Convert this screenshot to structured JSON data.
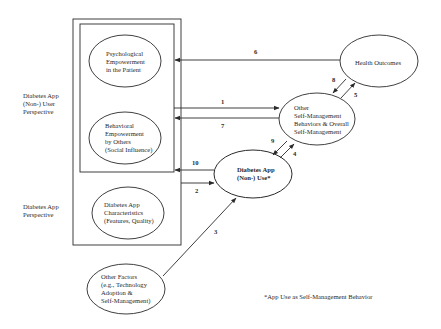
{
  "diagram": {
    "perspectives": {
      "user": [
        "Diabetes App",
        "(Non-) User",
        "Perspective"
      ],
      "app": [
        "Diabetes App",
        "Perspective"
      ]
    },
    "nodes": {
      "psychological": [
        "Psychological",
        "Empowerment",
        "in the Patient"
      ],
      "behavioral": [
        "Behavioral",
        "Empowerment",
        "by Others",
        "(Social Influence)"
      ],
      "characteristics": [
        "Diabetes App",
        "Characteristics",
        "(Features, Quality)"
      ],
      "other_factors": [
        "Other Factors",
        "(e.g., Technology",
        "Adoption &",
        "Self-Management)"
      ],
      "health_outcomes": [
        "Health Outcomes"
      ],
      "other_self_mgmt": [
        "Other",
        "Self-Management",
        "Behaviors & Overall",
        "Self-Management"
      ],
      "app_use": [
        "Diabetes App",
        "(Non-) Use*"
      ]
    },
    "paths": {
      "p1": "1",
      "p2": "2",
      "p3": "3",
      "p4": "4",
      "p5": "5",
      "p6": "6",
      "p7": "7",
      "p8": "8",
      "p9": "9",
      "p10": "10"
    },
    "footnote": "*App Use as Self-Management Behavior",
    "colors": {
      "stroke": "#2a2a2a",
      "text": "#2a2a2a",
      "background": "#ffffff"
    }
  }
}
